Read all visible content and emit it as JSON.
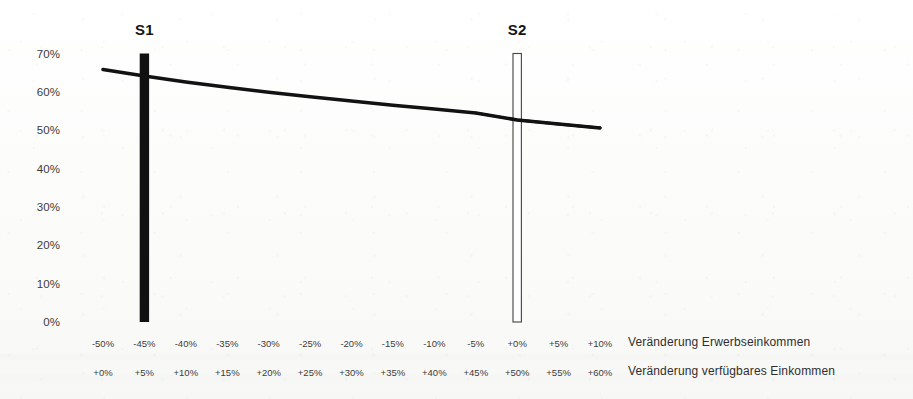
{
  "chart_data": {
    "type": "line",
    "title": "",
    "subtitle": "",
    "xlabel": "Veränderung Erwerbseinkommen",
    "xlabel_secondary": "Veränderung verfügbares Einkommen",
    "ylabel": "",
    "ylim": [
      0,
      70
    ],
    "ytick_labels": [
      "70%",
      "60%",
      "50%",
      "40%",
      "30%",
      "20%",
      "10%",
      "0%"
    ],
    "ytick_values": [
      70,
      60,
      50,
      40,
      30,
      20,
      10,
      0
    ],
    "grid": false,
    "legend_position": "none",
    "xtick_labels_row1": [
      "-50%",
      "-45%",
      "-40%",
      "-35%",
      "-30%",
      "-25%",
      "-20%",
      "-15%",
      "-10%",
      "-5%",
      "+0%",
      "+5%",
      "+10%"
    ],
    "xtick_labels_row2": [
      "+0%",
      "+5%",
      "+10%",
      "+15%",
      "+20%",
      "+25%",
      "+30%",
      "+35%",
      "+40%",
      "+45%",
      "+50%",
      "+55%",
      "+60%"
    ],
    "x": [
      -50,
      -45,
      -40,
      -35,
      -30,
      -25,
      -20,
      -15,
      -10,
      -5,
      0,
      5,
      10
    ],
    "series": [
      {
        "name": "Belastungsquote",
        "type": "line",
        "values": [
          65.8,
          64.1,
          62.6,
          61.2,
          59.9,
          58.7,
          57.6,
          56.5,
          55.5,
          54.5,
          52.7,
          51.6,
          50.6
        ]
      }
    ],
    "markers": [
      {
        "label": "S1",
        "x": -45,
        "x_secondary": 5,
        "value": 70,
        "style": "filled",
        "fill": "#111111"
      },
      {
        "label": "S2",
        "x": 0,
        "x_secondary": 50,
        "value": 70,
        "style": "outlined",
        "fill": "#ffffff",
        "stroke": "#4a4a4a"
      }
    ],
    "colors": {
      "line": "#121212",
      "marker_filled": "#111111",
      "marker_outline": "#4a4a4a",
      "text": "#3b3b3b",
      "background": "#fdfdfc"
    }
  }
}
